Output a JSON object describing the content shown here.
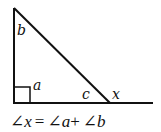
{
  "diagram": {
    "stroke_color": "#111111",
    "background": "#ffffff",
    "labels": {
      "top_angle": "b",
      "right_angle": "a",
      "interior_angle": "c",
      "exterior_angle": "x"
    },
    "equation": {
      "angle_symbol": "∠",
      "lhs_var": "x",
      "equals": "=",
      "term1_var": "a",
      "plus": "+",
      "term2_var": "b",
      "full_text": "∠x = ∠a + ∠b"
    }
  }
}
